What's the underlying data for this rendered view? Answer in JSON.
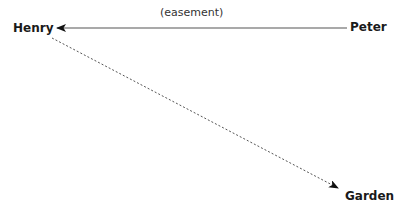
{
  "diagram": {
    "nodes": [
      {
        "id": "henry",
        "label": "Henry"
      },
      {
        "id": "peter",
        "label": "Peter"
      },
      {
        "id": "garden",
        "label": "Garden"
      }
    ],
    "edges": [
      {
        "from": "peter",
        "to": "henry",
        "label": "(easement)",
        "style": "solid"
      },
      {
        "from": "henry",
        "to": "garden",
        "label": "",
        "style": "dashed"
      }
    ],
    "colors": {
      "line": "#444444",
      "text": "#1a1a1a",
      "background": "#ffffff"
    }
  }
}
